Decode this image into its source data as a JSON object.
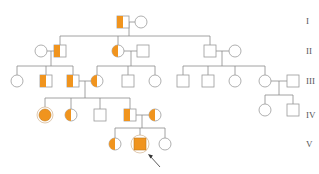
{
  "diagram": {
    "type": "pedigree",
    "colors": {
      "affected": "#f0941e",
      "line": "#8c8c8c",
      "shape_stroke": "#9a9a9a",
      "background": "#ffffff"
    },
    "generation_labels": [
      "I",
      "II",
      "III",
      "IV",
      "V"
    ],
    "legend": {
      "half_filled": "carrier / partially affected",
      "filled": "affected",
      "arrow": "proband"
    },
    "individuals": [
      {
        "id": "I-1",
        "sex": "male",
        "status": "half",
        "gen": 1
      },
      {
        "id": "I-2",
        "sex": "female",
        "status": "unaffected",
        "gen": 1
      },
      {
        "id": "II-1",
        "sex": "female",
        "status": "unaffected",
        "gen": 2
      },
      {
        "id": "II-2",
        "sex": "male",
        "status": "half",
        "gen": 2
      },
      {
        "id": "II-3",
        "sex": "female",
        "status": "half",
        "gen": 2
      },
      {
        "id": "II-4",
        "sex": "male",
        "status": "unaffected",
        "gen": 2
      },
      {
        "id": "II-5",
        "sex": "male",
        "status": "unaffected",
        "gen": 2
      },
      {
        "id": "II-6",
        "sex": "female",
        "status": "unaffected",
        "gen": 2
      },
      {
        "id": "III-1",
        "sex": "female",
        "status": "unaffected",
        "gen": 3
      },
      {
        "id": "III-2",
        "sex": "male",
        "status": "half",
        "gen": 3
      },
      {
        "id": "III-3",
        "sex": "male",
        "status": "half",
        "gen": 3
      },
      {
        "id": "III-4",
        "sex": "female",
        "status": "half",
        "gen": 3
      },
      {
        "id": "III-5",
        "sex": "male",
        "status": "unaffected",
        "gen": 3
      },
      {
        "id": "III-6",
        "sex": "female",
        "status": "unaffected",
        "gen": 3
      },
      {
        "id": "III-7",
        "sex": "male",
        "status": "unaffected",
        "gen": 3
      },
      {
        "id": "III-8",
        "sex": "male",
        "status": "unaffected",
        "gen": 3
      },
      {
        "id": "III-9",
        "sex": "female",
        "status": "unaffected",
        "gen": 3
      },
      {
        "id": "III-10",
        "sex": "female",
        "status": "unaffected",
        "gen": 3
      },
      {
        "id": "III-11",
        "sex": "male",
        "status": "unaffected",
        "gen": 3
      },
      {
        "id": "IV-1",
        "sex": "female",
        "status": "affected",
        "gen": 4
      },
      {
        "id": "IV-2",
        "sex": "female",
        "status": "half",
        "gen": 4
      },
      {
        "id": "IV-3",
        "sex": "male",
        "status": "unaffected",
        "gen": 4
      },
      {
        "id": "IV-4",
        "sex": "male",
        "status": "half",
        "gen": 4
      },
      {
        "id": "IV-5",
        "sex": "female",
        "status": "half",
        "gen": 4
      },
      {
        "id": "IV-6",
        "sex": "female",
        "status": "unaffected",
        "gen": 4
      },
      {
        "id": "IV-7",
        "sex": "male",
        "status": "unaffected",
        "gen": 4
      },
      {
        "id": "V-1",
        "sex": "female",
        "status": "half",
        "gen": 5
      },
      {
        "id": "V-2",
        "sex": "male",
        "status": "affected",
        "proband": true,
        "gen": 5
      },
      {
        "id": "V-3",
        "sex": "female",
        "status": "unaffected",
        "gen": 5
      }
    ]
  }
}
